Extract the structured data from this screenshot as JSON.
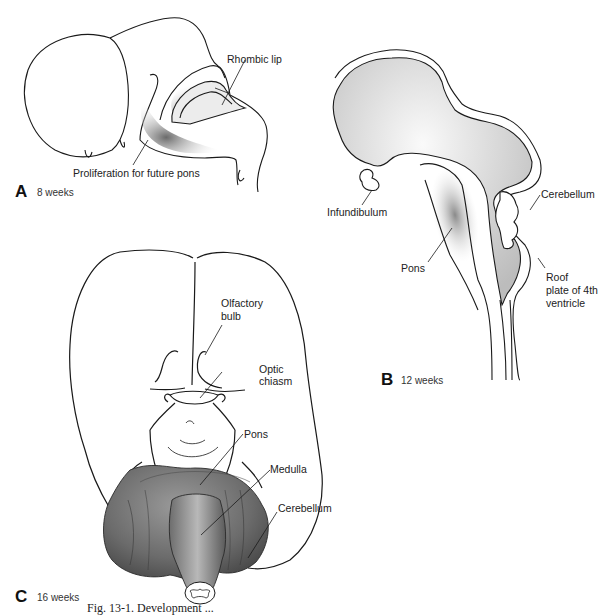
{
  "figure": {
    "caption_visible": "Fig. 13-1. Development ..."
  },
  "panels": [
    {
      "id": "A",
      "letter": "A",
      "age": "8 weeks",
      "labels": [
        "Rhombic lip",
        "Proliferation for future pons"
      ]
    },
    {
      "id": "B",
      "letter": "B",
      "age": "12 weeks",
      "labels": [
        "Infundibulum",
        "Pons",
        "Cerebellum",
        "Roof plate of 4th ventricle"
      ]
    },
    {
      "id": "C",
      "letter": "C",
      "age": "16 weeks",
      "labels": [
        "Olfactory bulb",
        "Optic chiasm",
        "Pons",
        "Medulla",
        "Cerebellum"
      ]
    }
  ],
  "labels": {
    "a_rhombic_lip": "Rhombic lip",
    "a_proliferation": "Proliferation for future pons",
    "b_infundibulum": "Infundibulum",
    "b_pons": "Pons",
    "b_cerebellum": "Cerebellum",
    "b_roof_1": "Roof",
    "b_roof_2": "plate of 4th",
    "b_roof_3": "ventricle",
    "c_olfactory_1": "Olfactory",
    "c_olfactory_2": "bulb",
    "c_optic_1": "Optic",
    "c_optic_2": "chiasm",
    "c_pons": "Pons",
    "c_medulla": "Medulla",
    "c_cerebellum": "Cerebellum"
  },
  "colors": {
    "line": "#1a1a1a",
    "shade_light": "#d9d9d9",
    "shade_dark": "#555555",
    "background": "#ffffff"
  }
}
